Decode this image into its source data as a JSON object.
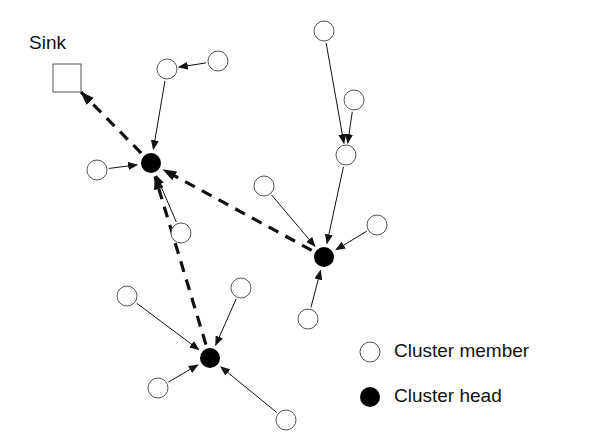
{
  "diagram": {
    "type": "wireless-sensor-network-clustering",
    "sink": {
      "label": "Sink",
      "x": 67,
      "y": 78
    },
    "legend": [
      {
        "symbol": "hollow-circle",
        "label": "Cluster member"
      },
      {
        "symbol": "filled-circle",
        "label": "Cluster head"
      }
    ],
    "cluster_heads": [
      {
        "id": "CH1",
        "x": 151,
        "y": 163
      },
      {
        "id": "CH2",
        "x": 324,
        "y": 257
      },
      {
        "id": "CH3",
        "x": 210,
        "y": 358
      }
    ],
    "members": [
      {
        "id": "M1",
        "x": 167,
        "y": 69
      },
      {
        "id": "M2",
        "x": 218,
        "y": 61
      },
      {
        "id": "M3",
        "x": 97,
        "y": 170
      },
      {
        "id": "M4",
        "x": 181,
        "y": 233
      },
      {
        "id": "M5",
        "x": 324,
        "y": 31
      },
      {
        "id": "M6",
        "x": 354,
        "y": 100
      },
      {
        "id": "M7",
        "x": 346,
        "y": 155
      },
      {
        "id": "M8",
        "x": 264,
        "y": 186
      },
      {
        "id": "M9",
        "x": 377,
        "y": 225
      },
      {
        "id": "M10",
        "x": 308,
        "y": 319
      },
      {
        "id": "M11",
        "x": 127,
        "y": 296
      },
      {
        "id": "M12",
        "x": 241,
        "y": 288
      },
      {
        "id": "M13",
        "x": 158,
        "y": 388
      },
      {
        "id": "M14",
        "x": 286,
        "y": 420
      }
    ],
    "member_links": [
      [
        "M2",
        "M1"
      ],
      [
        "M1",
        "CH1"
      ],
      [
        "M3",
        "CH1"
      ],
      [
        "M4",
        "CH1"
      ],
      [
        "M5",
        "M7"
      ],
      [
        "M6",
        "M7"
      ],
      [
        "M7",
        "CH2"
      ],
      [
        "M8",
        "CH2"
      ],
      [
        "M9",
        "CH2"
      ],
      [
        "M10",
        "CH2"
      ],
      [
        "M11",
        "CH3"
      ],
      [
        "M12",
        "CH3"
      ],
      [
        "M13",
        "CH3"
      ],
      [
        "M14",
        "CH3"
      ]
    ],
    "head_links": [
      [
        "CH1",
        "SINK"
      ],
      [
        "CH2",
        "CH1"
      ],
      [
        "CH3",
        "CH1"
      ]
    ]
  }
}
